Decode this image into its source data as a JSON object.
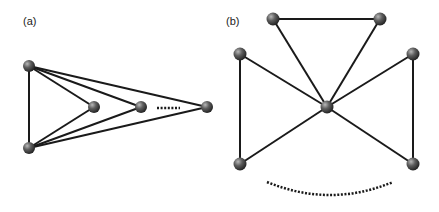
{
  "panels": [
    {
      "label": "(a)",
      "nodes": [
        "top-left",
        "bottom-left",
        "inner-1",
        "inner-2",
        "far-right"
      ],
      "edges": [
        [
          "top-left",
          "bottom-left"
        ],
        [
          "top-left",
          "inner-1"
        ],
        [
          "top-left",
          "inner-2"
        ],
        [
          "top-left",
          "far-right"
        ],
        [
          "bottom-left",
          "inner-1"
        ],
        [
          "bottom-left",
          "inner-2"
        ],
        [
          "bottom-left",
          "far-right"
        ]
      ],
      "ellipsis": "between inner-2 and far-right"
    },
    {
      "label": "(b)",
      "nodes": [
        "center",
        "top-left",
        "top-right",
        "left-upper",
        "left-lower",
        "right-upper",
        "right-lower"
      ],
      "edges": [
        [
          "top-left",
          "top-right"
        ],
        [
          "top-left",
          "center"
        ],
        [
          "top-right",
          "center"
        ],
        [
          "left-upper",
          "left-lower"
        ],
        [
          "left-upper",
          "center"
        ],
        [
          "left-lower",
          "center"
        ],
        [
          "right-upper",
          "right-lower"
        ],
        [
          "right-upper",
          "center"
        ],
        [
          "right-lower",
          "center"
        ]
      ],
      "ellipsis": "arc below center"
    }
  ]
}
